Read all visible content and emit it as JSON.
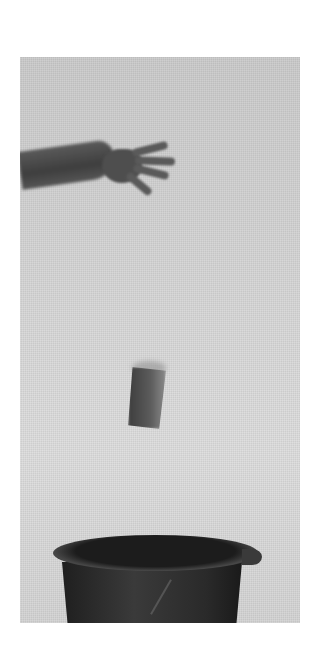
{
  "image": {
    "description": "Grayscale photograph of an outstretched hand that has just released a falling paper cup above a dark bucket with a spout",
    "subjects": [
      "hand",
      "falling cup",
      "bucket"
    ],
    "colors": {
      "background": "#ffffff",
      "photo_backdrop": "#d4d4d4",
      "hand": "#4e4e4e",
      "cup": "#5c5c5c",
      "bucket": "#2a2a2a"
    }
  }
}
